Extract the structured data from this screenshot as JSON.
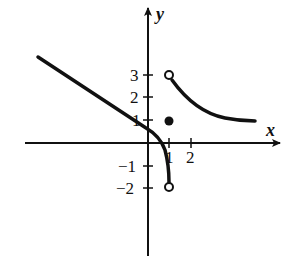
{
  "graph": {
    "x_axis_label": "x",
    "y_axis_label": "y",
    "x_ticks": [
      {
        "value": 1,
        "label": "1"
      },
      {
        "value": 2,
        "label": "2"
      }
    ],
    "y_ticks": [
      {
        "value": 3,
        "label": "3"
      },
      {
        "value": 2,
        "label": "2"
      },
      {
        "value": 1,
        "label": "1"
      },
      {
        "value": -1,
        "label": "−1"
      },
      {
        "value": -2,
        "label": "−2"
      }
    ],
    "features": {
      "left_piece": "line with negative slope from upper-left curving down to open circle at (1,-2)",
      "open_circle_top": {
        "x": 1,
        "y": 3
      },
      "open_circle_bottom": {
        "x": 1,
        "y": -2
      },
      "closed_dot": {
        "x": 1,
        "y": 1
      },
      "right_piece": "decreasing curve from open circle (1,3) toward x-axis"
    },
    "stroke_color": "#111111"
  }
}
